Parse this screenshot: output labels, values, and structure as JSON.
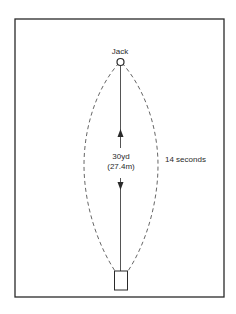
{
  "diagram": {
    "jack_label": "Jack",
    "distance_yards": "30yd",
    "distance_meters": "(27.4m)",
    "time_label": "14 seconds",
    "colors": {
      "line": "#2a2a2a",
      "dashed_path": "#555555",
      "background": "#ffffff"
    }
  }
}
